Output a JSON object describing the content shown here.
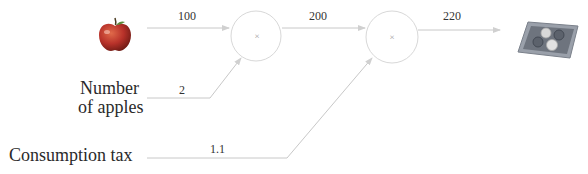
{
  "diagram": {
    "type": "computational-graph",
    "inputs": {
      "apple": {
        "icon": "apple-icon",
        "value": "100"
      },
      "number_of_apples": {
        "label": "Number\nof apples",
        "label_line1": "Number",
        "label_line2": "of apples",
        "value": "2"
      },
      "consumption_tax": {
        "label": "Consumption tax",
        "value": "1.1"
      }
    },
    "nodes": [
      {
        "id": "mul1",
        "op": "×",
        "output": "200"
      },
      {
        "id": "mul2",
        "op": "×",
        "output": "220"
      }
    ],
    "output": {
      "icon": "money-tray-icon",
      "value": "220"
    },
    "colors": {
      "wire": "#c8c8c8",
      "node_stroke": "#d8d8d8",
      "apple": "#c0392b",
      "apple_leaf": "#5a8a3a",
      "tray": "#8a8f99"
    }
  }
}
